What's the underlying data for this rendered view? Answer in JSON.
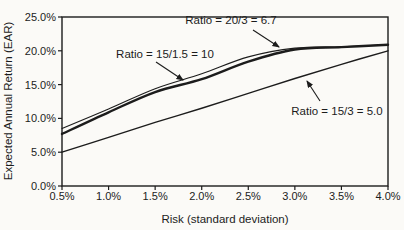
{
  "figure": {
    "background": "#fbfaf7",
    "ink_color": "#1c1c1c"
  },
  "chart_data": {
    "type": "line",
    "title": "",
    "xlabel": "Risk (standard deviation)",
    "ylabel": "Expected Annual Return (EAR)",
    "xlim": [
      0.5,
      4.0
    ],
    "ylim": [
      0,
      25
    ],
    "grid": false,
    "legend_position": "none (inline arrowed annotations)",
    "x_ticks": [
      "0.5%",
      "1.0%",
      "1.5%",
      "2.0%",
      "2.5%",
      "3.0%",
      "3.5%",
      "4.0%"
    ],
    "y_ticks": [
      "0.0%",
      "5.0%",
      "10.0%",
      "15.0%",
      "20.0%",
      "25.0%"
    ],
    "x": [
      0.5,
      1.0,
      1.5,
      2.0,
      2.5,
      3.0,
      3.5,
      4.0
    ],
    "series": [
      {
        "name": "Ratio = 20/3 = 6.7",
        "values": [
          8.5,
          11.4,
          14.4,
          16.6,
          19.1,
          20.4,
          20.6,
          20.9
        ],
        "stroke_width": 1.1
      },
      {
        "name": "Ratio = 15/1.5 = 10",
        "values": [
          7.7,
          10.9,
          13.9,
          15.8,
          18.4,
          20.2,
          20.55,
          20.9
        ],
        "stroke_width": 2.4
      },
      {
        "name": "Ratio = 15/3 = 5.0",
        "values": [
          5.0,
          7.2,
          9.4,
          11.5,
          13.7,
          15.9,
          18.0,
          20.0
        ],
        "stroke_width": 1.4
      }
    ],
    "annotations": [
      {
        "label": "Ratio = 20/3 = 6.7"
      },
      {
        "label": "Ratio = 15/1.5 = 10"
      },
      {
        "label": "Ratio = 15/3 = 5.0"
      }
    ]
  }
}
